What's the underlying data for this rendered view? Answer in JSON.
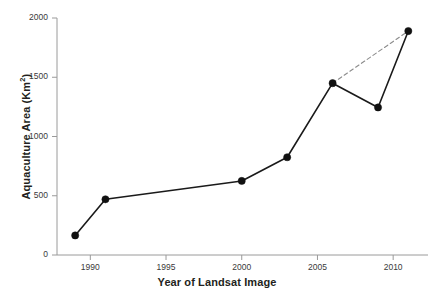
{
  "chart_data": {
    "type": "line",
    "title": "",
    "xlabel": "Year of Landsat Image",
    "ylabel": "Aquaculture Area (Km2)",
    "ylabel_base": "Aquaculture Area (Km",
    "ylabel_sup": "2",
    "ylabel_tail": ")",
    "x": [
      1989,
      1991,
      2000,
      2003,
      2006,
      2009,
      2011
    ],
    "values": [
      165,
      470,
      625,
      825,
      1450,
      1245,
      1890
    ],
    "xlim": [
      1987.8,
      2012.3
    ],
    "ylim": [
      0,
      2000
    ],
    "xticks": [
      1990,
      1995,
      2000,
      2005,
      2010
    ],
    "xtick_labels": [
      "1990",
      "1995",
      "2000",
      "2005",
      "2010"
    ],
    "yticks": [
      0,
      500,
      1000,
      1500,
      2000
    ],
    "ytick_labels": [
      "0",
      "500",
      "1000",
      "1500",
      "2000"
    ],
    "grid": false,
    "legend": "none",
    "series": [
      {
        "name": "Aquaculture Area",
        "style": "solid",
        "marker": "filled-circle",
        "color": "#1a1a1a",
        "points": [
          {
            "x": 1989,
            "y": 165
          },
          {
            "x": 1991,
            "y": 470
          },
          {
            "x": 2000,
            "y": 625
          },
          {
            "x": 2003,
            "y": 825
          },
          {
            "x": 2006,
            "y": 1450
          },
          {
            "x": 2009,
            "y": 1245
          },
          {
            "x": 2011,
            "y": 1890
          }
        ]
      },
      {
        "name": "Trend 2006-2011",
        "style": "dashed",
        "marker": "none",
        "color": "#8c8c8c",
        "points": [
          {
            "x": 2006,
            "y": 1450
          },
          {
            "x": 2011,
            "y": 1890
          }
        ]
      }
    ],
    "annotations": []
  },
  "colors": {
    "line": "#1a1a1a",
    "marker": "#111111",
    "dashed": "#8c8c8c",
    "axis": "#9a9a9a",
    "text": "#231f20"
  }
}
